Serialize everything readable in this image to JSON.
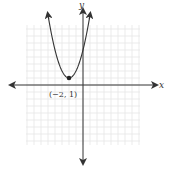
{
  "chart_data": {
    "type": "line",
    "title": "",
    "function": "y = (x + 2)^2 + 1",
    "xlabel": "x",
    "ylabel": "y",
    "xlim": [
      -8,
      8
    ],
    "ylim": [
      -8,
      8
    ],
    "grid": true,
    "legend": null,
    "series": [
      {
        "name": "parabola",
        "x": [
          -5,
          -4,
          -3,
          -2,
          -1,
          0,
          1
        ],
        "y": [
          10,
          5,
          2,
          1,
          2,
          5,
          10
        ]
      }
    ],
    "annotations": [
      {
        "label": "(−2, 1)",
        "x": -2,
        "y": 1,
        "marker": "dot"
      }
    ]
  },
  "labels": {
    "x_axis": "x",
    "y_axis": "y",
    "vertex": "(−2, 1)"
  },
  "colors": {
    "grid": "#e6e6e6",
    "axis": "#333333",
    "curve": "#333333",
    "point": "#222222"
  }
}
